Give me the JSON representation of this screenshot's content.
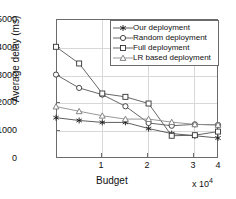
{
  "chart_data": {
    "type": "line",
    "title": "",
    "xlabel": "Budget",
    "ylabel": "Average delay (ms)",
    "x_exponent_label": "x 10",
    "x_exponent_power": "4",
    "x": [
      0.5,
      1.0,
      1.5,
      2.0,
      2.5,
      3.0,
      3.5,
      4.0
    ],
    "xlim": [
      0.5,
      4.0
    ],
    "ylim": [
      0,
      5000
    ],
    "xticks": [
      1,
      2,
      3,
      4
    ],
    "xticklabels": [
      "1",
      "2",
      "3",
      "4"
    ],
    "yticks": [
      0,
      1000,
      2000,
      3000,
      4000,
      5000
    ],
    "yticklabels": [
      "0",
      "1000",
      "2000",
      "3000",
      "4000",
      "5000"
    ],
    "grid": true,
    "legend_position": "upper right",
    "series": [
      {
        "name": "Our deployment",
        "marker": "star-icon",
        "color": "#4d4d4d",
        "values": [
          1450,
          1350,
          1280,
          1280,
          1060,
          880,
          800,
          720
        ]
      },
      {
        "name": "Random deployment",
        "marker": "circle-icon",
        "color": "#555555",
        "values": [
          3000,
          2520,
          2280,
          1860,
          1260,
          1160,
          1210,
          1190
        ]
      },
      {
        "name": "Full deployment",
        "marker": "square-icon",
        "color": "#555555",
        "values": [
          4000,
          3400,
          2320,
          2200,
          1960,
          800,
          820,
          950
        ]
      },
      {
        "name": "LR based deployment",
        "marker": "triangle-icon",
        "color": "#8c8c8c",
        "values": [
          1850,
          1680,
          1520,
          1400,
          1400,
          1290,
          1210,
          1190
        ]
      }
    ]
  },
  "legend": {
    "items": [
      {
        "label": "Our deployment"
      },
      {
        "label": "Random deployment"
      },
      {
        "label": "Full deployment"
      },
      {
        "label": "LR based deployment"
      }
    ]
  }
}
